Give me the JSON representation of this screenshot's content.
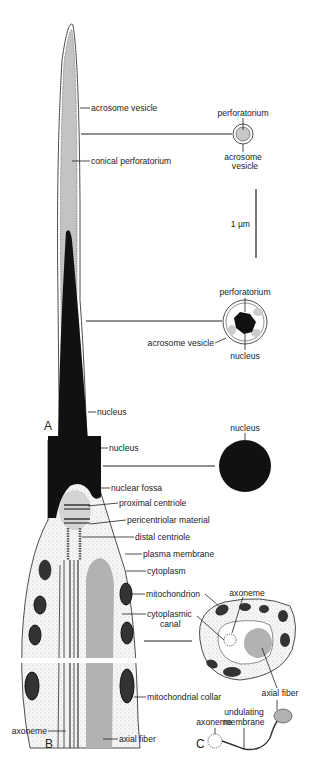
{
  "figure": {
    "panels": {
      "A": "A",
      "B": "B",
      "C": "C"
    },
    "scale_bar": {
      "label": "1 µm"
    },
    "panel_A": {
      "labels": {
        "acrosome_vesicle": "acrosome vesicle",
        "conical_perforatorium": "conical perforatorium",
        "nucleus": "nucleus"
      },
      "cross_section_1": {
        "perforatorium": "perforatorium",
        "acrosome_vesicle_line1": "acrosome",
        "acrosome_vesicle_line2": "vesicle"
      },
      "cross_section_2": {
        "perforatorium": "perforatorium",
        "acrosome_vesicle": "acrosome vesicle",
        "nucleus": "nucleus"
      }
    },
    "panel_B": {
      "labels": {
        "nucleus": "nucleus",
        "nuclear_fossa": "nuclear fossa",
        "proximal_centriole": "proximal centriole",
        "pericentriolar_material": "pericentriolar material",
        "distal_centriole": "distal centriole",
        "plasma_membrane": "plasma membrane",
        "cytoplasm": "cytoplasm",
        "mitochondrion": "mitochondrion",
        "cytoplasmic_canal_line1": "cytoplasmic",
        "cytoplasmic_canal_line2": "canal",
        "mitochondrial_collar": "mitochondrial collar",
        "axoneme": "axoneme",
        "axial_fiber": "axial fiber"
      },
      "cross_section_nucleus": {
        "nucleus": "nucleus"
      },
      "cross_section_midpiece": {
        "axoneme": "axoneme",
        "axial_fiber": "axial fiber"
      }
    },
    "panel_C": {
      "labels": {
        "axoneme": "axoneme",
        "undulating_membrane_line1": "undulating",
        "undulating_membrane_line2": "membrane",
        "axial_fiber": "axial fiber"
      }
    },
    "colors": {
      "black": "#111111",
      "grey": "#b5b5b5",
      "light": "#dcdcdc",
      "line": "#222222"
    }
  }
}
